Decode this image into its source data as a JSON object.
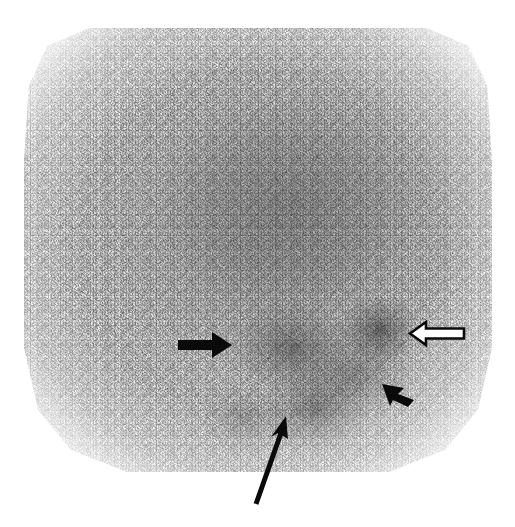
{
  "figure": {
    "type": "nuclear-medicine-scintigraphy",
    "modality_label": "planar gamma camera scintigram",
    "caption": "",
    "background_color": "#ffffff",
    "field_of_view": {
      "shape": "chamfered-square",
      "left_px": 24,
      "top_px": 28,
      "width_px": 468,
      "height_px": 444
    }
  },
  "image_content": {
    "grayscale": true,
    "noise": "high photon (Poisson) speckle",
    "regions": [
      {
        "name": "diffuse-uptake-upper-central",
        "description": "broad region of moderate tracer uptake occupying the upper and central field",
        "center_pct": [
          57,
          40
        ],
        "intensity": "moderate"
      },
      {
        "name": "focal-hotspot-central",
        "description": "focal area of increased tracer accumulation left of midline, indicated by the solid black arrow",
        "center_pct": [
          57,
          72
        ],
        "intensity": "high"
      },
      {
        "name": "focal-hotspot-right-lateral",
        "description": "discrete focus of increased uptake in the right lateral field, indicated by the open (hollow) arrow",
        "center_pct": [
          76,
          68
        ],
        "intensity": "high"
      },
      {
        "name": "focal-hotspot-inferior-right",
        "description": "focus of increased uptake inferolaterally, indicated by the short solid arrowhead",
        "center_pct": [
          70,
          80
        ],
        "intensity": "high"
      },
      {
        "name": "focal-hotspot-inferior-central",
        "description": "focus of increased uptake at the inferior midline, indicated by the long thin arrow",
        "center_pct": [
          57,
          88
        ],
        "intensity": "high"
      }
    ]
  },
  "annotations": {
    "color_solid": "#0a0a0a",
    "color_hollow_fill": "#ffffff",
    "color_hollow_stroke": "#0a0a0a",
    "markers": [
      {
        "id": "arrow-solid-right",
        "style": "solid-filled",
        "direction": "right",
        "label": "",
        "points_to": "focal-hotspot-central",
        "x_px": 176,
        "y_px": 329,
        "length_px": 56
      },
      {
        "id": "arrow-hollow-left",
        "style": "hollow-outline",
        "direction": "left",
        "label": "",
        "points_to": "focal-hotspot-right-lateral",
        "x_px": 406,
        "y_px": 318,
        "length_px": 60
      },
      {
        "id": "arrow-short-upleft",
        "style": "solid-filled-short",
        "direction": "up-left",
        "label": "",
        "points_to": "focal-hotspot-inferior-right",
        "x_px": 378,
        "y_px": 378,
        "length_px": 36
      },
      {
        "id": "arrow-long-upright",
        "style": "solid-thin-long",
        "direction": "up-right",
        "label": "",
        "points_to": "focal-hotspot-inferior-central",
        "x_px": 248,
        "y_px": 412,
        "length_px": 92
      }
    ]
  }
}
